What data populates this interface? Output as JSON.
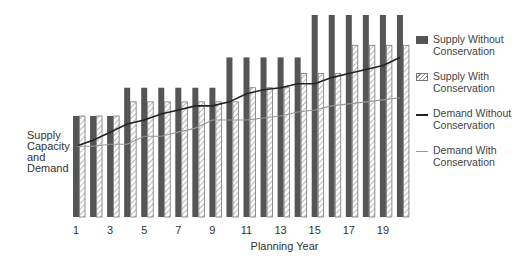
{
  "chart_data": {
    "type": "bar",
    "title": "",
    "xlabel": "Planning Year",
    "ylabel": "Supply Capacity and Demand",
    "categories": [
      1,
      2,
      3,
      4,
      5,
      6,
      7,
      8,
      9,
      10,
      11,
      12,
      13,
      14,
      15,
      16,
      17,
      18,
      19,
      20
    ],
    "x_tick_labels": [
      "1",
      "3",
      "5",
      "7",
      "9",
      "11",
      "13",
      "15",
      "17",
      "19"
    ],
    "ylim": [
      0,
      100
    ],
    "y_ticks_shown": false,
    "grid": false,
    "legend_position": "right",
    "series": [
      {
        "name": "Supply Without Conservation",
        "kind": "bar",
        "style": "solid-dark",
        "values": [
          50,
          50,
          50,
          64,
          64,
          64,
          64,
          64,
          64,
          79,
          79,
          79,
          79,
          79,
          100,
          100,
          100,
          100,
          100,
          100
        ]
      },
      {
        "name": "Supply With Conservation",
        "kind": "bar",
        "style": "hatched",
        "values": [
          50,
          50,
          50,
          57,
          57,
          57,
          57,
          57,
          57,
          57,
          64,
          64,
          64,
          71,
          71,
          71,
          85,
          85,
          85,
          85
        ]
      },
      {
        "name": "Demand Without Conservation",
        "kind": "line",
        "style": "dark",
        "values": [
          35,
          38,
          42,
          46,
          48,
          51,
          53,
          55,
          55,
          57,
          61,
          63,
          64,
          66,
          66,
          69,
          71,
          73,
          75,
          79
        ]
      },
      {
        "name": "Demand With Conservation",
        "kind": "line",
        "style": "gray",
        "values": [
          35,
          35,
          36,
          36,
          40,
          40,
          42,
          44,
          48,
          48,
          48,
          49,
          50,
          52,
          53,
          55,
          56,
          57,
          58,
          59
        ]
      }
    ]
  },
  "legend": [
    {
      "line1": "Supply Without",
      "line2": "Conservation"
    },
    {
      "line1": "Supply With",
      "line2": "Conservation"
    },
    {
      "line1": "Demand Without",
      "line2": "Conservation"
    },
    {
      "line1": "Demand With",
      "line2": "Conservation"
    }
  ],
  "axis": {
    "ylabel_lines": [
      "Supply",
      "Capacity",
      "and",
      "Demand"
    ],
    "xlabel": "Planning Year"
  },
  "colors": {
    "supply_without": "#555555",
    "supply_with_hatch": "#888888",
    "demand_without": "#222222",
    "demand_with": "#999999"
  }
}
